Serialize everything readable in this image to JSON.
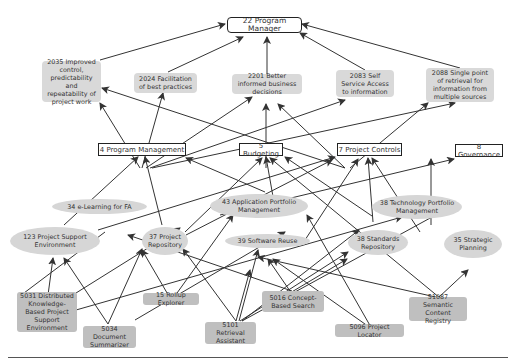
{
  "diagram": {
    "colors": {
      "line": "#333333",
      "objective_fill": "#d9d9d9",
      "ellipse_fill": "#d6d6d6",
      "tool_fill": "#bfbfbf",
      "box_border": "#222222"
    },
    "nodes": {
      "n22": {
        "label": "22 Program Manager"
      },
      "n2035": {
        "label": "2035 Improved control, predictability and repeatability of project work"
      },
      "n2024": {
        "label": "2024 Facilitation of best practices"
      },
      "n2201": {
        "label": "2201 Better informed business decisions"
      },
      "n2083": {
        "label": "2083 Self Service Access to information"
      },
      "n2088": {
        "label": "2088 Single point of retrieval for information from multiple sources"
      },
      "n4": {
        "label": "4 Program Management"
      },
      "n5": {
        "label": "5 Budgeting"
      },
      "n7": {
        "label": "7 Project Controls"
      },
      "n8": {
        "label": "8 Governance"
      },
      "n34": {
        "label": "34 e-Learning for FA"
      },
      "n43": {
        "label": "43 Application Portfolio Management"
      },
      "n38t": {
        "label": "38 Technology Portfolio Management"
      },
      "n123": {
        "label": "123 Project Support Environment"
      },
      "n37": {
        "label": "37 Project Repository"
      },
      "n39": {
        "label": "39 Software Reuse"
      },
      "n38s": {
        "label": "38 Standards Repository"
      },
      "n35": {
        "label": "35 Strategic Planning"
      },
      "n5031": {
        "label": "5031 Distributed Knowledge-Based Project Support Environment"
      },
      "n15": {
        "label": "15 Rollup Explorer"
      },
      "n5016": {
        "label": "5016 Concept-Based Search"
      },
      "n51087": {
        "label": "51087 Semantic Content Registry"
      },
      "n5034": {
        "label": "5034 Document Summarizer"
      },
      "n5101": {
        "label": "5101 Retrieval Assistant"
      },
      "n5096": {
        "label": "5096 Project Locator"
      }
    }
  }
}
